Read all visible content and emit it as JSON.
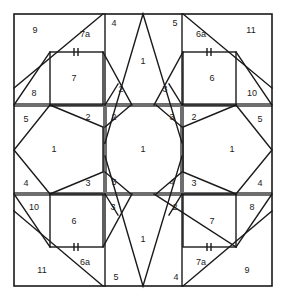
{
  "diagram": {
    "type": "quilt-block-piecing-diagram",
    "width": 286,
    "height": 300,
    "background_color": "#ffffff",
    "thin_line_color": "#1a1a1a",
    "thick_line_color": "#6e6e6e",
    "border_color": "#1a1a1a",
    "label_color": "#1a1a1a",
    "symmetry": "4-fold rotational",
    "tick_mark_symbol": "‖",
    "section_count": 9,
    "labels": {
      "top_left": {
        "p9": "9",
        "p7a": "7a",
        "p8": "8",
        "p7": "7",
        "tick": "‖"
      },
      "top_center": {
        "p4": "4",
        "p5": "5",
        "p1": "1",
        "p2": "2",
        "p3": "3"
      },
      "top_right": {
        "p6a": "6a",
        "p11": "11",
        "p6": "6",
        "p10": "10",
        "tick": "‖"
      },
      "mid_left": {
        "p5": "5",
        "p2": "2",
        "p1": "1",
        "p4": "4",
        "p3": "3"
      },
      "center": {
        "p2tl": "2",
        "p3tr": "3",
        "p1": "1",
        "p5bl": "5",
        "p4br": "4"
      },
      "mid_right": {
        "p3": "3",
        "p2": "2",
        "p1": "1",
        "p5": "5",
        "p4": "4"
      },
      "bottom_left": {
        "p10": "10",
        "p6": "6",
        "p11": "11",
        "p6a": "6a",
        "p5": "5",
        "tick": "‖"
      },
      "bottom_center": {
        "p3": "3",
        "p2": "2",
        "p1": "1",
        "p5": "5",
        "p4": "4"
      },
      "bottom_right": {
        "p2": "2",
        "p7": "7",
        "p8": "8",
        "p7a": "7a",
        "p9": "9",
        "p4": "4",
        "tick": "‖"
      },
      "edge_numbers": {
        "top_left_inner_3": "3",
        "top_right_inner_3": "3",
        "left_upper_2": "2",
        "left_lower_3": "3",
        "right_upper_3": "3",
        "right_lower_4": "4",
        "bottom_left_5": "5",
        "bottom_right_2": "2"
      }
    }
  }
}
